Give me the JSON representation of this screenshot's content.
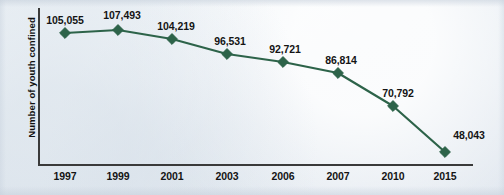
{
  "chart_data": {
    "type": "line",
    "title": "",
    "subtitle": "",
    "xlabel": "",
    "ylabel": "Number of youth confined",
    "categories": [
      "1997",
      "1999",
      "2001",
      "2003",
      "2006",
      "2007",
      "2010",
      "2015"
    ],
    "values": [
      105055,
      107493,
      104219,
      96531,
      92721,
      86814,
      70792,
      48043
    ],
    "value_labels": [
      "105,055",
      "107,493",
      "104,219",
      "96,531",
      "92,721",
      "86,814",
      "70,792",
      "48,043"
    ],
    "series": [
      {
        "name": "Number of youth confined",
        "values": [
          105055,
          107493,
          104219,
          96531,
          92721,
          86814,
          70792,
          48043
        ]
      }
    ],
    "ylim": [
      40000,
      112000
    ],
    "grid": false,
    "legend": false,
    "legend_position": "none",
    "marker": "diamond",
    "colors": {
      "series": "#2d6349",
      "line": "#2d6349",
      "marker": "#2d6349",
      "axis": "#3a3a3a",
      "text": "#141414",
      "background": "#eef3f7"
    },
    "points": [
      {
        "x": "1997",
        "label": "105,055",
        "value": 105055,
        "px": 65,
        "py": 33,
        "lx": 65,
        "ly": 14
      },
      {
        "x": "1999",
        "label": "107,493",
        "value": 107493,
        "px": 118,
        "py": 30,
        "lx": 122,
        "ly": 9
      },
      {
        "x": "2001",
        "label": "104,219",
        "value": 104219,
        "px": 172,
        "py": 39,
        "lx": 176,
        "ly": 20
      },
      {
        "x": "2003",
        "label": "96,531",
        "value": 96531,
        "px": 227,
        "py": 54,
        "lx": 230,
        "ly": 35
      },
      {
        "x": "2006",
        "label": "92,721",
        "value": 92721,
        "px": 283,
        "py": 62,
        "lx": 285,
        "ly": 43
      },
      {
        "x": "2007",
        "label": "86,814",
        "value": 86814,
        "px": 338,
        "py": 73,
        "lx": 341,
        "ly": 54
      },
      {
        "x": "2010",
        "label": "70,792",
        "value": 70792,
        "px": 393,
        "py": 106,
        "lx": 398,
        "ly": 87
      },
      {
        "x": "2015",
        "label": "48,043",
        "value": 48043,
        "px": 445,
        "py": 152,
        "lx": 469,
        "ly": 129
      }
    ],
    "tick_positions": [
      65,
      118,
      172,
      227,
      283,
      338,
      393,
      445
    ]
  }
}
